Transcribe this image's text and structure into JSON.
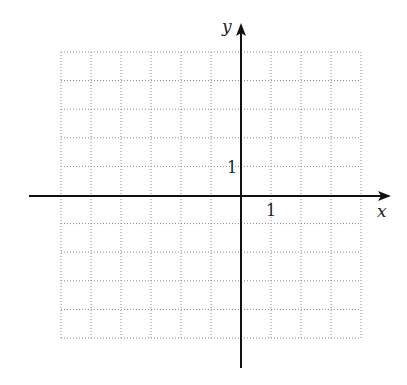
{
  "chart_data": {
    "type": "scatter",
    "title": "",
    "xlabel": "x",
    "ylabel": "y",
    "tick_labels": {
      "x": "1",
      "y": "1"
    },
    "xlim": [
      -6,
      4
    ],
    "ylim": [
      -5,
      5
    ],
    "grid": true,
    "grid_style": "dotted",
    "x_grid_values": [
      -6,
      -5,
      -4,
      -3,
      -2,
      -1,
      0,
      1,
      2,
      3,
      4
    ],
    "y_grid_values": [
      -5,
      -4,
      -3,
      -2,
      -1,
      0,
      1,
      2,
      3,
      4,
      5
    ],
    "series": []
  },
  "colors": {
    "axis": "#111111",
    "grid": "#8a8a8a",
    "background": "#ffffff"
  }
}
